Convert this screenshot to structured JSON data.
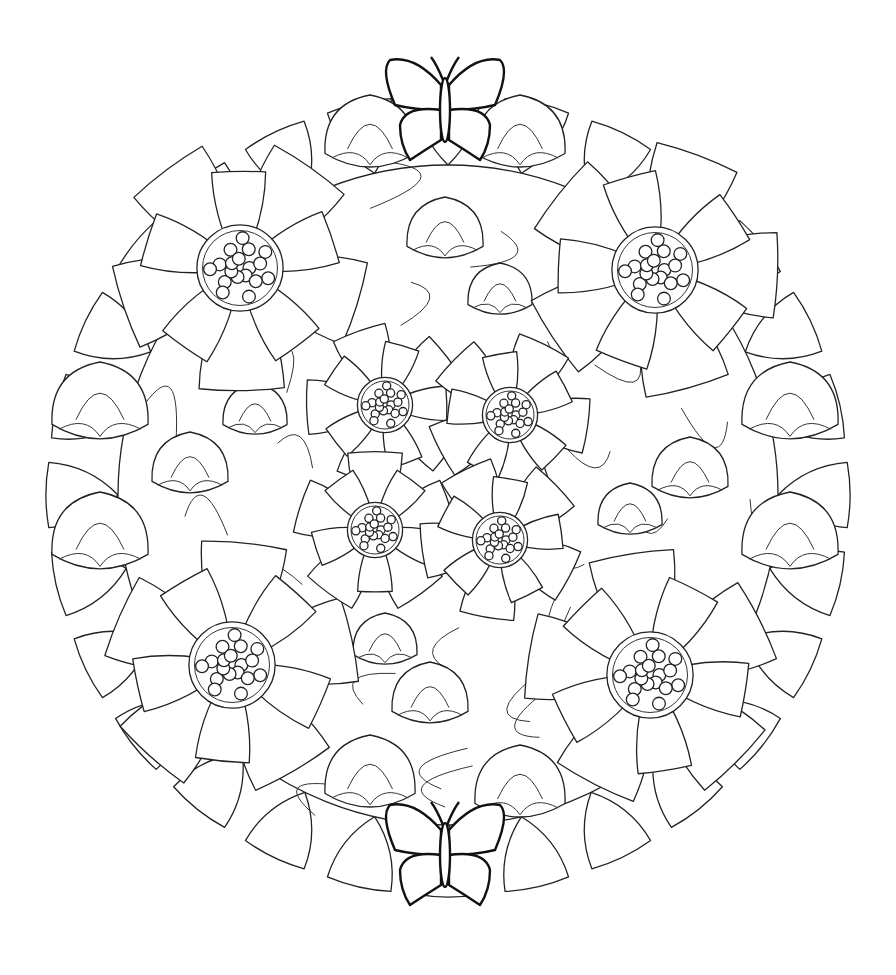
{
  "artwork": {
    "subject": "floral mandala coloring page",
    "style": "black line art on white",
    "line_color": "#222222",
    "background": "#ffffff",
    "center": [
      448,
      495
    ],
    "radius": 400,
    "large_flowers": [
      {
        "cx": 240,
        "cy": 268,
        "r": 125
      },
      {
        "cx": 655,
        "cy": 270,
        "r": 125
      },
      {
        "cx": 232,
        "cy": 665,
        "r": 125
      },
      {
        "cx": 650,
        "cy": 675,
        "r": 125
      }
    ],
    "medium_flowers": [
      {
        "cx": 385,
        "cy": 405,
        "r": 80
      },
      {
        "cx": 510,
        "cy": 415,
        "r": 80
      },
      {
        "cx": 375,
        "cy": 530,
        "r": 80
      },
      {
        "cx": 500,
        "cy": 540,
        "r": 80
      }
    ],
    "buds": [
      {
        "cx": 445,
        "cy": 235,
        "r": 38
      },
      {
        "cx": 500,
        "cy": 295,
        "r": 32
      },
      {
        "cx": 100,
        "cy": 410,
        "r": 48
      },
      {
        "cx": 100,
        "cy": 540,
        "r": 48
      },
      {
        "cx": 790,
        "cy": 410,
        "r": 48
      },
      {
        "cx": 790,
        "cy": 540,
        "r": 48
      },
      {
        "cx": 190,
        "cy": 470,
        "r": 38
      },
      {
        "cx": 255,
        "cy": 415,
        "r": 32
      },
      {
        "cx": 690,
        "cy": 475,
        "r": 38
      },
      {
        "cx": 630,
        "cy": 515,
        "r": 32
      },
      {
        "cx": 385,
        "cy": 645,
        "r": 32
      },
      {
        "cx": 430,
        "cy": 700,
        "r": 38
      },
      {
        "cx": 370,
        "cy": 140,
        "r": 45
      },
      {
        "cx": 520,
        "cy": 140,
        "r": 45
      },
      {
        "cx": 370,
        "cy": 780,
        "r": 45
      },
      {
        "cx": 520,
        "cy": 790,
        "r": 45
      }
    ],
    "butterflies": [
      {
        "cx": 445,
        "cy": 105,
        "scale": 1.0
      },
      {
        "cx": 445,
        "cy": 850,
        "scale": 1.0
      }
    ]
  }
}
